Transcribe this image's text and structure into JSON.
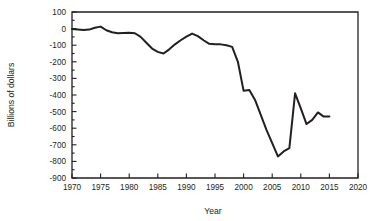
{
  "chart_data": {
    "type": "line",
    "title": "",
    "xlabel": "Year",
    "ylabel": "Billions of dollars",
    "xlim": [
      1970,
      2020
    ],
    "ylim": [
      -900,
      100
    ],
    "grid": false,
    "legend": "none",
    "xticks": [
      1970,
      1975,
      1980,
      1985,
      1990,
      1995,
      2000,
      2005,
      2010,
      2015,
      2020
    ],
    "yticks": [
      100,
      0,
      -100,
      -200,
      -300,
      -400,
      -500,
      -600,
      -700,
      -800,
      -900
    ],
    "xtick_labels": [
      "1970",
      "1975",
      "1980",
      "1985",
      "1990",
      "1995",
      "2000",
      "2005",
      "2010",
      "2015",
      "2020"
    ],
    "ytick_labels": [
      "100",
      "0",
      "-100",
      "-200",
      "-300",
      "-400",
      "-500",
      "-600",
      "-700",
      "-800",
      "-900"
    ],
    "minor_ytick_step": 50,
    "line_color": "#231f20",
    "series": [
      {
        "name": "Federal budget surplus or deficit",
        "x": [
          1970,
          1971,
          1972,
          1973,
          1974,
          1975,
          1976,
          1977,
          1978,
          1979,
          1980,
          1981,
          1982,
          1983,
          1984,
          1985,
          1986,
          1987,
          1988,
          1989,
          1990,
          1991,
          1992,
          1993,
          1994,
          1995,
          1996,
          1997,
          1998,
          1999,
          2000,
          2001,
          2002,
          2003,
          2004,
          2005,
          2006,
          2007,
          2008,
          2009,
          2010,
          2011,
          2012,
          2013,
          2014,
          2015
        ],
        "values": [
          -3,
          -5,
          -8,
          -6,
          5,
          12,
          -10,
          -22,
          -28,
          -26,
          -25,
          -28,
          -50,
          -85,
          -120,
          -140,
          -150,
          -125,
          -95,
          -70,
          -48,
          -30,
          -45,
          -70,
          -92,
          -95,
          -95,
          -100,
          -110,
          -200,
          -375,
          -370,
          -430,
          -520,
          -610,
          -690,
          -770,
          -740,
          -720,
          -390,
          -480,
          -575,
          -550,
          -505,
          -530,
          -530
        ]
      }
    ]
  },
  "axes": {
    "x_label": "Year",
    "y_label": "Billions of dollars"
  }
}
